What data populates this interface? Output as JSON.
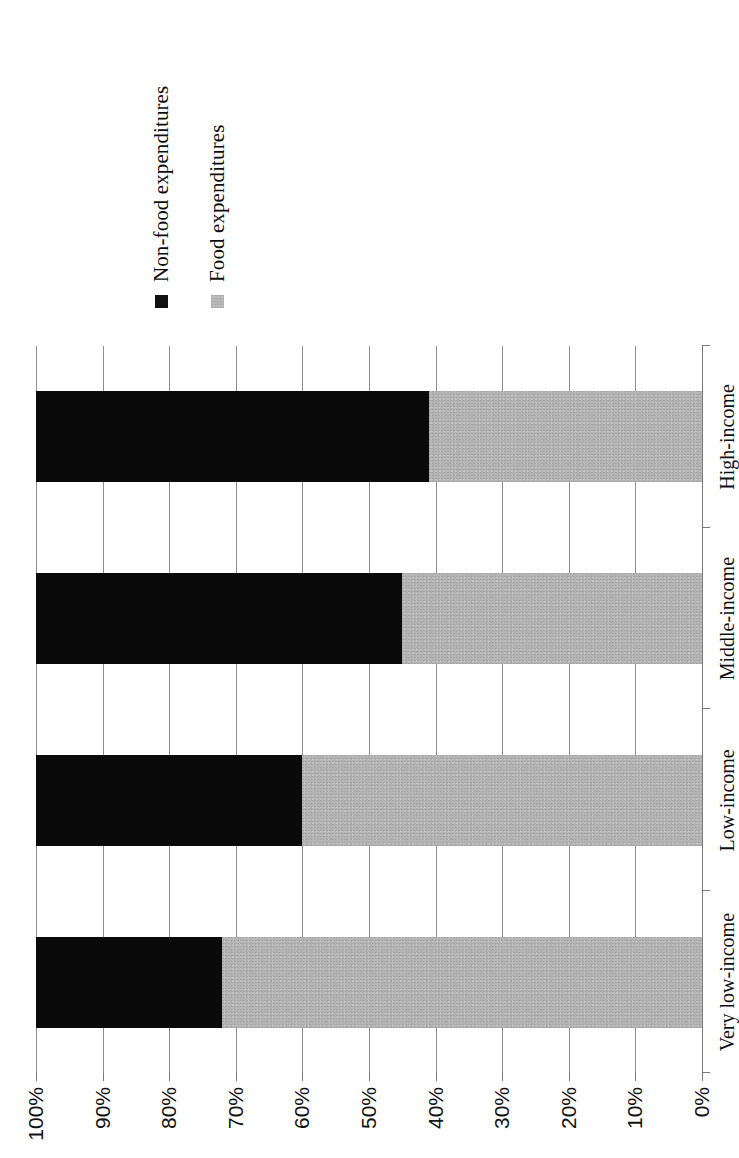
{
  "chart_data": {
    "type": "bar",
    "orientation": "horizontal-stacked",
    "title": "",
    "subtitle": "",
    "xlabel": "",
    "ylabel": "",
    "stacked": true,
    "stack_total": 100,
    "grid": true,
    "legend_position": "right",
    "categories": [
      "Very low-income",
      "Low-income",
      "Middle-income",
      "High-income"
    ],
    "category_order_top_to_bottom": [
      "Very low-income",
      "Low-income",
      "Middle-income",
      "High-income"
    ],
    "series": [
      {
        "name": "Non-food expenditures",
        "color": "#0a0a0a",
        "values": [
          28,
          40,
          55,
          59
        ]
      },
      {
        "name": "Food expenditures",
        "color": "#b5b5b5",
        "values": [
          72,
          60,
          45,
          41
        ]
      }
    ],
    "value_axis": {
      "min": 0,
      "max": 100,
      "direction": "100-to-0",
      "tick_values": [
        100,
        90,
        80,
        70,
        60,
        50,
        40,
        30,
        20,
        10,
        0
      ],
      "tick_labels": [
        "100%",
        "90%",
        "80%",
        "70%",
        "60%",
        "50%",
        "40%",
        "30%",
        "20%",
        "10%",
        "0%"
      ]
    }
  },
  "legend": {
    "items": [
      {
        "label": "Non-food expenditures",
        "swatch": "black"
      },
      {
        "label": "Food expenditures",
        "swatch": "gray"
      }
    ]
  },
  "axis": {
    "ticks": [
      "100%",
      "90%",
      "80%",
      "70%",
      "60%",
      "50%",
      "40%",
      "30%",
      "20%",
      "10%",
      "0%"
    ]
  },
  "categories": [
    "Very low-income",
    "Low-income",
    "Middle-income",
    "High-income"
  ],
  "colors": {
    "nonfood": "#0a0a0a",
    "food": "#b5b5b5",
    "grid": "#8e8e8e",
    "axis": "#7a7a7a",
    "text": "#101010",
    "background": "#ffffff"
  }
}
